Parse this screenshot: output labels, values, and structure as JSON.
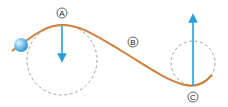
{
  "diagram": {
    "labels": {
      "A": "A",
      "B": "B",
      "C": "C"
    },
    "colors": {
      "track": "#c8742e",
      "arrow": "#2a9fd6",
      "circle": "#888888",
      "ball": "#5ab4ea"
    }
  }
}
